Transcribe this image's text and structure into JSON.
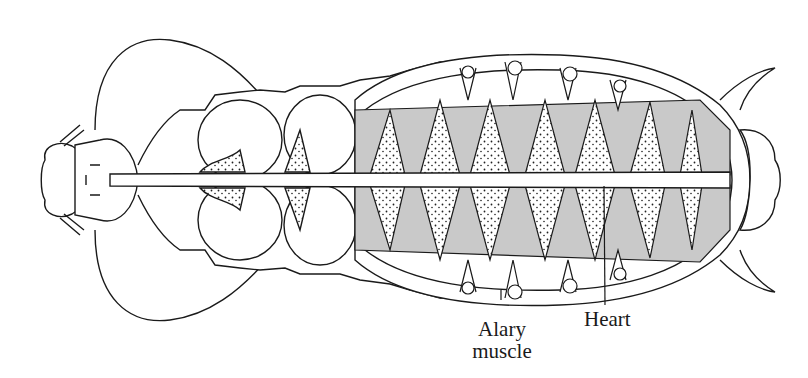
{
  "figure": {
    "colors": {
      "line": "#1a1a1a",
      "muscle_fill": "#c9c9c9",
      "stipple_fill": "#ffffff",
      "background": "#ffffff"
    }
  },
  "labels": {
    "alary_muscle_line1": "Alary",
    "alary_muscle_line2": "muscle",
    "heart": "Heart"
  }
}
